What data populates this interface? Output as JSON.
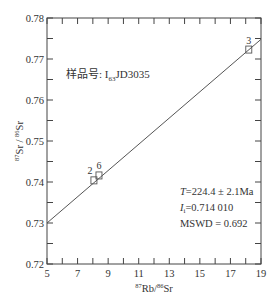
{
  "chart_data": {
    "type": "scatter",
    "title": "",
    "xlabel": "87Rb/86Sr",
    "ylabel": "87Sr / 86Sr",
    "xlabel_parts": {
      "sup1": "87",
      "base1": "Rb/",
      "sup2": "86",
      "base2": "Sr"
    },
    "ylabel_parts": {
      "sup1": "87",
      "base1": "Sr / ",
      "sup2": "86",
      "base2": "Sr"
    },
    "xlim": [
      5,
      19
    ],
    "ylim": [
      0.72,
      0.78
    ],
    "x_ticks_major": [
      5,
      7,
      9,
      11,
      13,
      15,
      17,
      19
    ],
    "x_ticks_minor": [
      6,
      8,
      10,
      12,
      14,
      16,
      18
    ],
    "x_tick_labels": [
      "5",
      "7",
      "9",
      "11",
      "13",
      "15",
      "17",
      "19"
    ],
    "y_ticks_major": [
      0.72,
      0.73,
      0.74,
      0.75,
      0.76,
      0.77,
      0.78
    ],
    "y_ticks_minor": [
      0.725,
      0.735,
      0.745,
      0.755,
      0.765,
      0.775
    ],
    "y_tick_labels": [
      "0.72",
      "0.73",
      "0.74",
      "0.75",
      "0.76",
      "0.77",
      "0.78"
    ],
    "grid": false,
    "points": [
      {
        "label": "2",
        "x": 8.07,
        "y": 0.7404
      },
      {
        "label": "6",
        "x": 8.4,
        "y": 0.7416
      },
      {
        "label": "3",
        "x": 18.2,
        "y": 0.7723
      }
    ],
    "isochron": {
      "x": [
        5,
        19
      ],
      "y": [
        0.73,
        0.7748
      ]
    },
    "annotations": {
      "sample": "样品号: I63JD3035",
      "age": "T=224.4 ± 2.1Ma",
      "initial_ratio": "Ii=0.714 010",
      "mswd": "MSWD = 0.692"
    }
  },
  "labels": {
    "sample_prefix": "样品号:  I",
    "sample_sub": "63",
    "sample_suffix": "JD3035",
    "age_sym": "T",
    "age_val": "=224.4 ± 2.1Ma",
    "ii_sym": "I",
    "ii_sub": "i",
    "ii_val": "=0.714 010",
    "mswd": "MSWD = 0.692",
    "x_sup1": "87",
    "x_base1": "Rb/",
    "x_sup2": "86",
    "x_base2": "Sr",
    "y_sup1": "87",
    "y_base1": "Sr / ",
    "y_sup2": "86",
    "y_base2": "Sr"
  },
  "colors": {
    "axis": "#444444",
    "line": "#555555",
    "marker": "#555555",
    "text": "#333333"
  }
}
